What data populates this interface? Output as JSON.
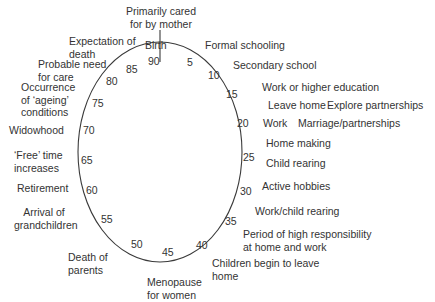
{
  "diagram": {
    "type": "life-cycle ellipse",
    "ring_color": "#3a3a3a",
    "top_label": "Primarily cared for by mother",
    "birth_label": "Birth",
    "ages": [
      "90",
      "5",
      "10",
      "15",
      "20",
      "25",
      "30",
      "35",
      "40",
      "45",
      "50",
      "55",
      "60",
      "65",
      "70",
      "75",
      "80",
      "85"
    ],
    "right_events": [
      "Formal schooling",
      "Secondary school",
      "Work or higher education",
      "Leave home",
      "Explore partnerships",
      "Work",
      "Marriage/partnerships",
      "Home making",
      "Child rearing",
      "Active hobbies",
      "Work/child rearing",
      "Period of high responsibility at home and work",
      "Children begin to leave home"
    ],
    "bottom_events": [
      "Menopause for women"
    ],
    "left_events": [
      "Death of parents",
      "Arrival of grandchildren",
      "Retirement",
      "'Free' time increases",
      "Widowhood",
      "Occurrence of 'ageing' conditions",
      "Probable need for care",
      "Expectation of death"
    ]
  },
  "labels": {
    "top1": "Primarily cared",
    "top2": "for by mother",
    "birth": "Birth",
    "formal": "Formal schooling",
    "secondary": "Secondary school",
    "workhe": "Work or higher education",
    "leave": "Leave home",
    "explore": "Explore partnerships",
    "work": "Work",
    "marriage": "Marriage/partnerships",
    "homemaking": "Home making",
    "childrearing": "Child rearing",
    "hobbies": "Active hobbies",
    "workchild": "Work/child rearing",
    "period1": "Period of high responsibility",
    "period2": "at home and work",
    "children1": "Children begin to leave",
    "children2": "home",
    "meno1": "Menopause",
    "meno2": "for women",
    "death1": "Death of",
    "death2": "parents",
    "arrival1": "Arrival of",
    "arrival2": "grandchildren",
    "retirement": "Retirement",
    "free1": "‘Free’ time",
    "free2": "increases",
    "widowhood": "Widowhood",
    "occ1": "Occurrence",
    "occ2": "of ‘ageing’",
    "occ3": "conditions",
    "care1": "Probable need",
    "care2": "for care",
    "exp1": "Expectation of",
    "exp2": "death"
  },
  "numbers": {
    "n90": "90",
    "n5": "5",
    "n10": "10",
    "n15": "15",
    "n20": "20",
    "n25": "25",
    "n30": "30",
    "n35": "35",
    "n40": "40",
    "n45": "45",
    "n50": "50",
    "n55": "55",
    "n60": "60",
    "n65": "65",
    "n70": "70",
    "n75": "75",
    "n80": "80",
    "n85": "85"
  }
}
